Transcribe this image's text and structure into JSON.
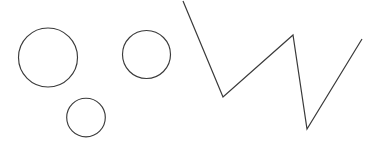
{
  "canvas": {
    "width": 371,
    "height": 156,
    "background_color": "#ffffff",
    "stroke_color": "#3a3a3a",
    "title": "Shapes Sketch",
    "description": "Three hand-drawn circles on the left and one open zigzag polyline on the right"
  },
  "chart_data": {
    "type": "scatter",
    "title": "Shapes Sketch",
    "xlabel": "",
    "ylabel": "",
    "xlim": [
      0,
      371
    ],
    "ylim": [
      156,
      0
    ],
    "grid": false,
    "legend": "none",
    "shapes": [
      {
        "name": "large-circle",
        "type": "circle",
        "cx": 48,
        "cy": 57.5,
        "r": 29.5,
        "stroke": "#3a3a3a",
        "fill": "none"
      },
      {
        "name": "medium-circle",
        "type": "circle",
        "cx": 146.5,
        "cy": 54.5,
        "r": 24,
        "stroke": "#3a3a3a",
        "fill": "none"
      },
      {
        "name": "small-circle",
        "type": "circle",
        "cx": 86,
        "cy": 117.5,
        "r": 19.3,
        "stroke": "#3a3a3a",
        "fill": "none"
      },
      {
        "name": "zigzag-polyline",
        "type": "polyline",
        "points": [
          [
            183,
            1
          ],
          [
            223,
            97
          ],
          [
            293,
            35
          ],
          [
            307,
            129
          ],
          [
            362,
            39
          ]
        ],
        "stroke": "#3a3a3a",
        "fill": "none"
      }
    ]
  }
}
